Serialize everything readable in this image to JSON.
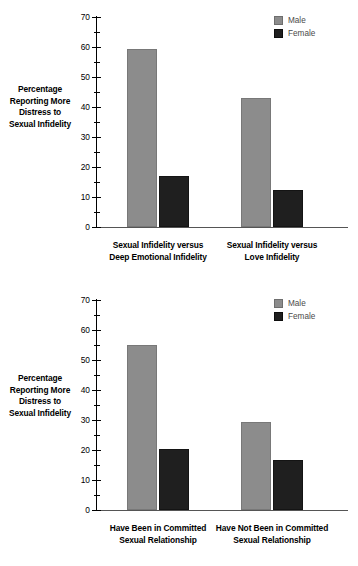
{
  "chart_data": [
    {
      "type": "bar",
      "title": "",
      "xlabel": "",
      "ylabel": "Percentage Reporting More Distress to Sexual Infidelity",
      "ylabel_lines": [
        "Percentage",
        "Reporting More",
        "Distress to",
        "Sexual Infidelity"
      ],
      "ylim": [
        0,
        70
      ],
      "ytick_step": 10,
      "yminor_step": 5,
      "yticks": [
        "0",
        "10",
        "20",
        "30",
        "40",
        "50",
        "60",
        "70"
      ],
      "grid": false,
      "legend_position": "top-right",
      "categories": [
        "Sexual Infidelity versus Deep Emotional Infidelity",
        "Sexual Infidelity versus Love Infidelity"
      ],
      "category_lines": [
        [
          "Sexual Infidelity versus",
          "Deep Emotional Infidelity"
        ],
        [
          "Sexual Infidelity versus",
          "Love Infidelity"
        ]
      ],
      "series": [
        {
          "name": "Male",
          "color": "#8c8c8c",
          "values": [
            59.5,
            43
          ]
        },
        {
          "name": "Female",
          "color": "#1f1f1f",
          "values": [
            17,
            12.3
          ]
        }
      ]
    },
    {
      "type": "bar",
      "title": "",
      "xlabel": "",
      "ylabel": "Percentage Reporting More Distress to Sexual Infidelity",
      "ylabel_lines": [
        "Percentage",
        "Reporting More",
        "Distress to",
        "Sexual Infidelity"
      ],
      "ylim": [
        0,
        70
      ],
      "ytick_step": 10,
      "yminor_step": 5,
      "yticks": [
        "0",
        "10",
        "20",
        "30",
        "40",
        "50",
        "60",
        "70"
      ],
      "grid": false,
      "legend_position": "top-right",
      "categories": [
        "Have Been in Committed Sexual Relationship",
        "Have Not Been in Committed Sexual Relationship"
      ],
      "category_lines": [
        [
          "Have Been in Committed",
          "Sexual Relationship"
        ],
        [
          "Have Not Been in Committed",
          "Sexual Relationship"
        ]
      ],
      "series": [
        {
          "name": "Male",
          "color": "#8c8c8c",
          "values": [
            55,
            29.4
          ]
        },
        {
          "name": "Female",
          "color": "#1f1f1f",
          "values": [
            20.2,
            16.7
          ]
        }
      ]
    }
  ],
  "legend": {
    "male_label": "Male",
    "female_label": "Female"
  },
  "colors": {
    "male": "#8c8c8c",
    "female": "#1f1f1f",
    "axis": "#000000",
    "background": "#ffffff"
  }
}
